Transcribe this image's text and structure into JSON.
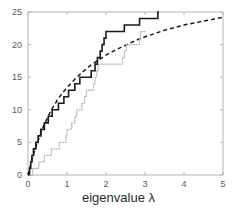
{
  "chart_data": {
    "type": "line",
    "title": "",
    "subtitle": "",
    "xlabel": "eigenvalue λ",
    "ylabel": "",
    "xlim": [
      0,
      5
    ],
    "ylim": [
      0,
      25
    ],
    "xticks": [
      0,
      1,
      2,
      3,
      4,
      5
    ],
    "xticklabels": [
      "0",
      "1",
      "2",
      "3",
      "4",
      "5"
    ],
    "yticks": [
      0,
      5,
      10,
      15,
      20,
      25
    ],
    "yticklabels": [
      "0",
      "5",
      "10",
      "15",
      "20",
      "25"
    ],
    "grid": false,
    "legend": "none",
    "box": true,
    "axis_color": "#b4b4b4",
    "tick_label_color": "#5a5a5a",
    "series": [
      {
        "name": "empirical-counting-solid",
        "style": "solid-step",
        "color": "#1a1a1a",
        "linewidth": 1.6,
        "points": [
          [
            0.0,
            0
          ],
          [
            0.04,
            0
          ],
          [
            0.04,
            1
          ],
          [
            0.07,
            1
          ],
          [
            0.07,
            2
          ],
          [
            0.1,
            2
          ],
          [
            0.1,
            3
          ],
          [
            0.14,
            3
          ],
          [
            0.14,
            4
          ],
          [
            0.2,
            4
          ],
          [
            0.2,
            5
          ],
          [
            0.26,
            5
          ],
          [
            0.26,
            6
          ],
          [
            0.33,
            6
          ],
          [
            0.33,
            7
          ],
          [
            0.42,
            7
          ],
          [
            0.42,
            8
          ],
          [
            0.52,
            8
          ],
          [
            0.52,
            9
          ],
          [
            0.62,
            9
          ],
          [
            0.62,
            10
          ],
          [
            0.78,
            10
          ],
          [
            0.78,
            11
          ],
          [
            0.92,
            11
          ],
          [
            0.92,
            12
          ],
          [
            1.04,
            12
          ],
          [
            1.04,
            13
          ],
          [
            1.2,
            13
          ],
          [
            1.2,
            14
          ],
          [
            1.33,
            14
          ],
          [
            1.33,
            15
          ],
          [
            1.62,
            15
          ],
          [
            1.62,
            16
          ],
          [
            1.72,
            16
          ],
          [
            1.72,
            17
          ],
          [
            1.78,
            17
          ],
          [
            1.78,
            18
          ],
          [
            1.85,
            18
          ],
          [
            1.85,
            19
          ],
          [
            1.9,
            19
          ],
          [
            1.9,
            20
          ],
          [
            1.95,
            20
          ],
          [
            1.95,
            21
          ],
          [
            2.0,
            21
          ],
          [
            2.0,
            22
          ],
          [
            2.47,
            22
          ],
          [
            2.47,
            23
          ],
          [
            2.86,
            23
          ],
          [
            2.86,
            24
          ],
          [
            3.33,
            24
          ],
          [
            3.33,
            25
          ],
          [
            3.36,
            25
          ]
        ]
      },
      {
        "name": "theoretical-mean-dashed",
        "style": "dashed",
        "color": "#1a1a1a",
        "linewidth": 1.5,
        "dash": "4,3",
        "points": [
          [
            0.0,
            0.0
          ],
          [
            0.1,
            2.3
          ],
          [
            0.2,
            4.3
          ],
          [
            0.3,
            6.0
          ],
          [
            0.4,
            7.5
          ],
          [
            0.5,
            8.8
          ],
          [
            0.6,
            10.0
          ],
          [
            0.7,
            11.0
          ],
          [
            0.8,
            11.9
          ],
          [
            0.9,
            12.7
          ],
          [
            1.0,
            13.4
          ],
          [
            1.2,
            14.7
          ],
          [
            1.4,
            15.8
          ],
          [
            1.6,
            16.8
          ],
          [
            1.8,
            17.6
          ],
          [
            2.0,
            18.4
          ],
          [
            2.25,
            19.2
          ],
          [
            2.5,
            19.9
          ],
          [
            2.75,
            20.6
          ],
          [
            3.0,
            21.2
          ],
          [
            3.25,
            21.7
          ],
          [
            3.5,
            22.2
          ],
          [
            3.75,
            22.6
          ],
          [
            4.0,
            23.0
          ],
          [
            4.25,
            23.3
          ],
          [
            4.5,
            23.6
          ],
          [
            4.75,
            23.9
          ],
          [
            5.0,
            24.2
          ]
        ]
      },
      {
        "name": "lower-counting-dotted",
        "style": "dotted-step",
        "color": "#b9b9b9",
        "linewidth": 1.3,
        "points": [
          [
            0.05,
            0
          ],
          [
            0.12,
            0
          ],
          [
            0.12,
            1
          ],
          [
            0.28,
            1
          ],
          [
            0.28,
            2
          ],
          [
            0.42,
            2
          ],
          [
            0.42,
            3
          ],
          [
            0.6,
            3
          ],
          [
            0.6,
            4
          ],
          [
            0.8,
            4
          ],
          [
            0.8,
            5
          ],
          [
            0.97,
            5
          ],
          [
            0.97,
            6
          ],
          [
            1.0,
            6
          ],
          [
            1.0,
            7
          ],
          [
            1.12,
            7
          ],
          [
            1.12,
            8
          ],
          [
            1.2,
            8
          ],
          [
            1.2,
            9
          ],
          [
            1.25,
            9
          ],
          [
            1.25,
            10
          ],
          [
            1.38,
            10
          ],
          [
            1.38,
            11
          ],
          [
            1.45,
            11
          ],
          [
            1.45,
            12
          ],
          [
            1.5,
            12
          ],
          [
            1.5,
            13
          ],
          [
            1.68,
            13
          ],
          [
            1.68,
            14
          ],
          [
            1.72,
            14
          ],
          [
            1.72,
            15
          ],
          [
            1.76,
            15
          ],
          [
            1.76,
            16
          ],
          [
            1.8,
            16
          ],
          [
            1.8,
            17
          ],
          [
            2.42,
            17
          ],
          [
            2.42,
            18
          ],
          [
            2.47,
            18
          ],
          [
            2.47,
            19
          ],
          [
            2.52,
            19
          ],
          [
            2.52,
            20
          ],
          [
            2.86,
            20
          ],
          [
            2.86,
            21
          ],
          [
            2.88,
            21
          ],
          [
            2.88,
            22
          ],
          [
            3.0,
            22
          ]
        ]
      }
    ]
  },
  "axis_labels": {
    "x_title": "eigenvalue λ"
  }
}
